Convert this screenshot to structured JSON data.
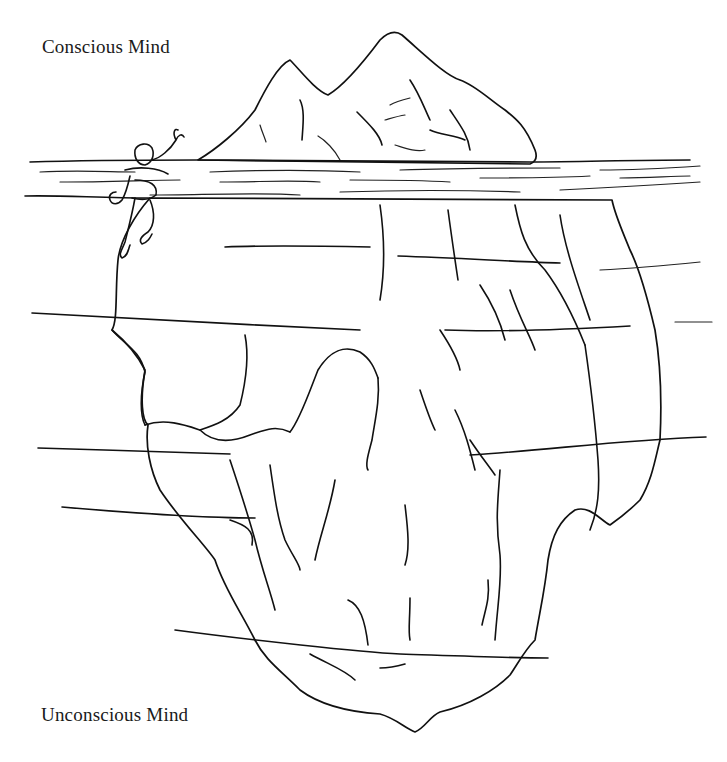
{
  "figure": {
    "labels": {
      "top": "Conscious Mind",
      "bottom": "Unconscious Mind"
    },
    "elements": [
      "iceberg-tip",
      "water-surface",
      "swimmer",
      "submerged-iceberg",
      "water-lines"
    ],
    "colors": {
      "background": "#ffffff",
      "ink": "#111111"
    }
  }
}
